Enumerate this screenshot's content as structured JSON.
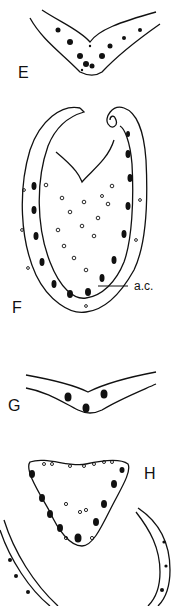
{
  "figure": {
    "panels": [
      {
        "id": "E",
        "label": "E",
        "description": "V-shaped leaf cross-section"
      },
      {
        "id": "F",
        "label": "F",
        "description": "Inrolled oval leaf cross-section",
        "annotation": "a.c."
      },
      {
        "id": "G",
        "label": "G",
        "description": "Shallow V-shaped leaf cross-section"
      },
      {
        "id": "H",
        "label": "H",
        "description": "Triangular leaf cross-section with curved partial leaf outline"
      }
    ],
    "colors": {
      "ink": "#111111",
      "paper": "#ffffff"
    }
  }
}
